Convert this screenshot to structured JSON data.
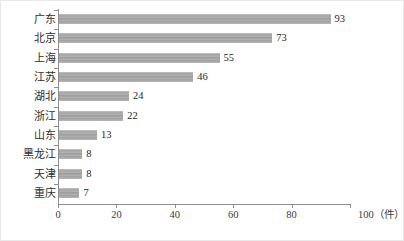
{
  "chart_data": {
    "type": "bar",
    "orientation": "horizontal",
    "title": "",
    "xlabel": "件",
    "ylabel": "",
    "xlim": [
      0,
      100
    ],
    "xticks": [
      0,
      20,
      40,
      60,
      80,
      100
    ],
    "xtick_labels": [
      "0",
      "20",
      "40",
      "60",
      "80",
      "100"
    ],
    "x_unit_label": "100（件）",
    "unit_suffix": "（件）",
    "grid": false,
    "legend": false,
    "categories": [
      "广东",
      "北京",
      "上海",
      "江苏",
      "湖北",
      "浙江",
      "山东",
      "黑龙江",
      "天津",
      "重庆"
    ],
    "values": [
      93,
      73,
      55,
      46,
      24,
      22,
      13,
      8,
      8,
      7
    ],
    "value_labels": [
      "93",
      "73",
      "55",
      "46",
      "24",
      "22",
      "13",
      "8",
      "8",
      "7"
    ],
    "bar_color": "#a8a8a8",
    "axis_color": "#8d8d8d",
    "text_color": "#2d2d2d",
    "background": "#ffffff"
  }
}
